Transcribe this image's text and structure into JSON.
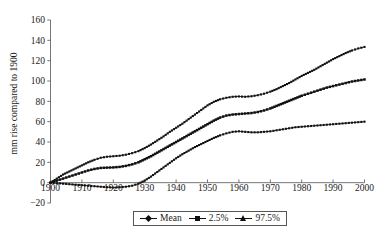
{
  "chart_data": {
    "type": "line",
    "title": "",
    "xlabel": "",
    "ylabel": "mm rise compared to 1900",
    "xlim": [
      1900,
      2000
    ],
    "ylim": [
      -20,
      160
    ],
    "ytick_labels": [
      "160",
      "140",
      "120",
      "100",
      "80",
      "60",
      "40",
      "20",
      "0",
      "−20"
    ],
    "ytick_values": [
      160,
      140,
      120,
      100,
      80,
      60,
      40,
      20,
      0,
      -20
    ],
    "xtick_labels": [
      "1900",
      "1910",
      "1920",
      "1930",
      "1940",
      "1950",
      "1960",
      "1970",
      "1980",
      "1990",
      "2000"
    ],
    "xtick_values": [
      1900,
      1910,
      1920,
      1930,
      1940,
      1950,
      1960,
      1970,
      1980,
      1990,
      2000
    ],
    "grid": false,
    "legend_position": "bottom-center",
    "legend": [
      {
        "name": "Mean",
        "marker": "diamond"
      },
      {
        "name": "2.5%",
        "marker": "square"
      },
      {
        "name": "97.5%",
        "marker": "triangle"
      }
    ],
    "x": [
      1900,
      1902,
      1904,
      1906,
      1908,
      1910,
      1912,
      1914,
      1916,
      1918,
      1920,
      1922,
      1924,
      1926,
      1928,
      1930,
      1932,
      1934,
      1936,
      1938,
      1940,
      1942,
      1944,
      1946,
      1948,
      1950,
      1952,
      1954,
      1956,
      1958,
      1960,
      1962,
      1964,
      1966,
      1968,
      1970,
      1972,
      1974,
      1976,
      1978,
      1980,
      1982,
      1984,
      1986,
      1988,
      1990,
      1992,
      1994,
      1996,
      1998,
      2000
    ],
    "series": [
      {
        "name": "Mean",
        "marker": "diamond",
        "values": [
          0,
          2,
          4,
          6,
          8,
          10,
          12,
          13.5,
          14.5,
          14.8,
          15,
          15.5,
          16.5,
          18,
          20,
          23,
          26,
          29.5,
          33,
          36.5,
          40,
          43.5,
          47,
          50.5,
          54,
          57.5,
          61,
          64,
          66,
          67,
          67.5,
          68,
          68.5,
          69.5,
          71,
          73,
          75.5,
          78,
          80.5,
          83,
          85.5,
          87.5,
          89.5,
          91.5,
          93.5,
          95,
          96.5,
          98,
          99.5,
          100.5,
          101.5
        ]
      },
      {
        "name": "2.5%",
        "marker": "square",
        "values": [
          0,
          -0.5,
          -1,
          -1.5,
          -2,
          -2.5,
          -3,
          -3.5,
          -4,
          -4.5,
          -4.8,
          -4.5,
          -4,
          -3,
          -1,
          2,
          6,
          10.5,
          15,
          19.5,
          24,
          28,
          31.5,
          35,
          38,
          41,
          44,
          46.5,
          48.5,
          50,
          50.5,
          50,
          49.5,
          49.5,
          50,
          50.5,
          51.5,
          52.5,
          53.5,
          54.5,
          55,
          55.5,
          56,
          56.5,
          57,
          57.5,
          58,
          58.5,
          59,
          59.5,
          60
        ]
      },
      {
        "name": "97.5%",
        "marker": "triangle",
        "values": [
          0,
          4,
          8,
          11,
          14,
          17,
          20,
          22.5,
          24.5,
          25.5,
          26,
          26.5,
          27.5,
          29,
          31,
          34,
          37.5,
          41.5,
          45.5,
          50,
          54,
          58,
          62.5,
          67,
          71.5,
          76,
          79.5,
          82,
          83.5,
          84.5,
          84.8,
          84.5,
          85,
          86,
          87.5,
          89.5,
          92,
          95,
          98,
          101.5,
          105,
          108,
          111,
          114.5,
          118,
          121.5,
          124.5,
          127.5,
          130,
          132,
          133.5
        ]
      }
    ]
  }
}
